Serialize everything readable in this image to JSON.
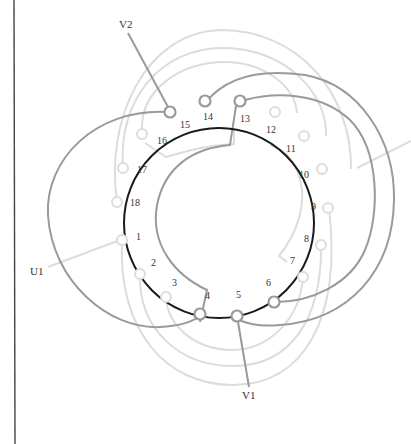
{
  "diagram": {
    "title": "",
    "type": "stator-winding-diagram",
    "slot_count": 18,
    "colors": {
      "stator_ring": "#1a1a1a",
      "phase_v": "#9a9a9a",
      "phase_light": "#dcdcdc",
      "label": "#333333",
      "border": "#444444"
    },
    "slots": [
      {
        "n": "1"
      },
      {
        "n": "2"
      },
      {
        "n": "3"
      },
      {
        "n": "4"
      },
      {
        "n": "5"
      },
      {
        "n": "6"
      },
      {
        "n": "7"
      },
      {
        "n": "8"
      },
      {
        "n": "9"
      },
      {
        "n": "10"
      },
      {
        "n": "11"
      },
      {
        "n": "12"
      },
      {
        "n": "13"
      },
      {
        "n": "14"
      },
      {
        "n": "15"
      },
      {
        "n": "16"
      },
      {
        "n": "17"
      },
      {
        "n": "18"
      }
    ],
    "leads": {
      "v2": "V2",
      "u1": "U1",
      "v1": "V1"
    }
  }
}
